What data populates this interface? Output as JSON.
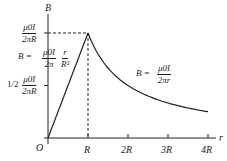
{
  "chart_data": {
    "type": "line",
    "title": "",
    "xlabel": "r",
    "ylabel": "B",
    "x_ticks": [
      "O",
      "R",
      "2R",
      "3R",
      "4R"
    ],
    "y_ticks": [
      "μ0I/2πR",
      "1/2 μ0I/2πR"
    ],
    "series": [
      {
        "name": "inside",
        "formula": "B = (μ0I/2π)(r/R²)",
        "x": [
          0,
          1
        ],
        "values": [
          0,
          1
        ]
      },
      {
        "name": "outside",
        "formula": "B = μ0I/2πr",
        "x": [
          1,
          1.5,
          2,
          2.5,
          3,
          3.5,
          4
        ],
        "values": [
          1,
          0.667,
          0.5,
          0.4,
          0.333,
          0.286,
          0.25
        ]
      }
    ],
    "units": "x in R, y in μ0I/2πR",
    "annotations": [
      "dashed line from peak to y-axis",
      "dashed line from peak to x-axis at R"
    ]
  },
  "axis": {
    "y_label": "B",
    "x_label": "r",
    "origin": "O",
    "ticks": [
      "R",
      "2R",
      "3R",
      "4R"
    ]
  },
  "labels": {
    "peak_num": "μ0I",
    "peak_den": "2πR",
    "half_coef": "1/2",
    "half_num": "μ0I",
    "half_den": "2πR",
    "inside_lhs": "B =",
    "inside_num": "μ0I",
    "inside_den": "2π",
    "inside_num2": "r",
    "inside_den2": "R²",
    "outside_lhs": "B =",
    "outside_num": "μ0I",
    "outside_den": "2πr"
  }
}
